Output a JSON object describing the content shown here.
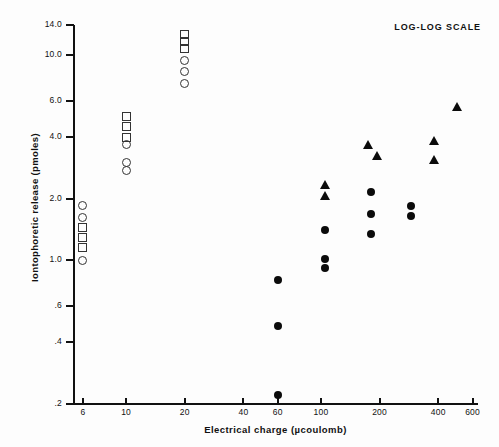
{
  "chart_data": {
    "type": "scatter",
    "title": "",
    "annotations": [
      "LOG-LOG SCALE"
    ],
    "xlabel": "Electrical charge (µcoulomb)",
    "ylabel": "Iontophoretic release (pmoles)",
    "xscale": "log",
    "yscale": "log",
    "xlim": [
      5.4,
      640
    ],
    "ylim": [
      0.2,
      14.0
    ],
    "grid": false,
    "legend": "none",
    "xticks": [
      6,
      10,
      20,
      40,
      60,
      100,
      200,
      400,
      600
    ],
    "xticklabels": [
      "6",
      "10",
      "20",
      "40",
      "60",
      "100",
      "200",
      "400",
      "600"
    ],
    "yticks": [
      0.2,
      0.4,
      0.6,
      1.0,
      2.0,
      4.0,
      6.0,
      10.0,
      14.0
    ],
    "yticklabels": [
      ".2",
      ".4",
      ".6",
      "1.0",
      "2.0",
      "4.0",
      "6.0",
      "10.0",
      "14.0"
    ],
    "series": [
      {
        "name": "open-circle",
        "marker": "open-circle",
        "points": [
          {
            "x": 6,
            "y": 1.85
          },
          {
            "x": 6,
            "y": 1.62
          },
          {
            "x": 6,
            "y": 1.0
          },
          {
            "x": 10,
            "y": 3.65
          },
          {
            "x": 10,
            "y": 3.0
          },
          {
            "x": 10,
            "y": 2.75
          },
          {
            "x": 20,
            "y": 9.4
          },
          {
            "x": 20,
            "y": 8.3
          },
          {
            "x": 20,
            "y": 7.3
          }
        ]
      },
      {
        "name": "open-square",
        "marker": "open-square",
        "points": [
          {
            "x": 6,
            "y": 1.45
          },
          {
            "x": 6,
            "y": 1.3
          },
          {
            "x": 6,
            "y": 1.15
          },
          {
            "x": 10,
            "y": 5.0
          },
          {
            "x": 10,
            "y": 4.5
          },
          {
            "x": 10,
            "y": 3.95
          },
          {
            "x": 20,
            "y": 12.6
          },
          {
            "x": 20,
            "y": 11.6
          },
          {
            "x": 20,
            "y": 10.8
          }
        ]
      },
      {
        "name": "filled-circle",
        "marker": "filled-circle",
        "points": [
          {
            "x": 60,
            "y": 0.8
          },
          {
            "x": 60,
            "y": 0.48
          },
          {
            "x": 60,
            "y": 0.22
          },
          {
            "x": 105,
            "y": 1.4
          },
          {
            "x": 105,
            "y": 1.02
          },
          {
            "x": 105,
            "y": 0.92
          },
          {
            "x": 180,
            "y": 2.15
          },
          {
            "x": 180,
            "y": 1.68
          },
          {
            "x": 180,
            "y": 1.35
          },
          {
            "x": 290,
            "y": 1.85
          },
          {
            "x": 290,
            "y": 1.65
          }
        ]
      },
      {
        "name": "filled-triangle",
        "marker": "filled-triangle",
        "points": [
          {
            "x": 105,
            "y": 2.35
          },
          {
            "x": 105,
            "y": 2.08
          },
          {
            "x": 175,
            "y": 3.65
          },
          {
            "x": 195,
            "y": 3.25
          },
          {
            "x": 380,
            "y": 3.85
          },
          {
            "x": 380,
            "y": 3.1
          },
          {
            "x": 500,
            "y": 5.6
          }
        ]
      }
    ]
  }
}
